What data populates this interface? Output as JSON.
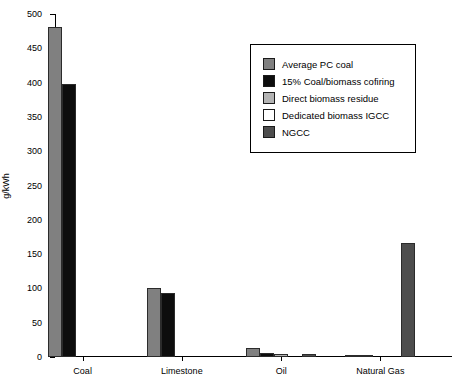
{
  "chart_data": {
    "type": "bar",
    "title": "",
    "subtitle": "",
    "xlabel": "",
    "ylabel": "g/kWh",
    "ylim": [
      0,
      500
    ],
    "yticks": [
      0,
      50,
      100,
      150,
      200,
      250,
      300,
      350,
      400,
      450,
      500
    ],
    "ytick_labels": [
      "0",
      "50",
      "100",
      "150",
      "200",
      "250",
      "300",
      "350",
      "400",
      "450",
      "500"
    ],
    "grid": false,
    "legend_position": "upper-right-inside",
    "categories": [
      "Coal",
      "Limestone",
      "Oil",
      "Natural Gas"
    ],
    "series": [
      {
        "name": "Average PC coal",
        "color": "#808080",
        "values": [
          481,
          101,
          13,
          2
        ]
      },
      {
        "name": "15% Coal/biomass cofiring",
        "color": "#0d0d0d",
        "values": [
          398,
          94,
          6,
          1
        ]
      },
      {
        "name": "Direct biomass residue",
        "color": "#b3b3b3",
        "values": [
          0,
          0,
          5,
          0
        ]
      },
      {
        "name": "Dedicated biomass IGCC",
        "color": "#ffffff",
        "values": [
          0,
          0,
          0,
          0
        ]
      },
      {
        "name": "NGCC",
        "color": "#4d4d4d",
        "values": [
          0,
          0,
          4,
          166
        ]
      }
    ]
  },
  "legend": {
    "entries": [
      {
        "label": "Average PC coal",
        "color": "#808080"
      },
      {
        "label": "15% Coal/biomass cofiring",
        "color": "#0d0d0d"
      },
      {
        "label": "Direct biomass residue",
        "color": "#b3b3b3"
      },
      {
        "label": "Dedicated biomass IGCC",
        "color": "#ffffff"
      },
      {
        "label": "NGCC",
        "color": "#4d4d4d"
      }
    ]
  }
}
